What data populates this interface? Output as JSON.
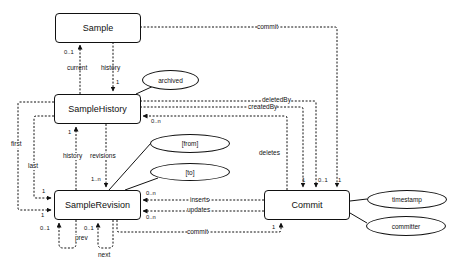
{
  "entities": {
    "sample": "Sample",
    "sample_history": "SampleHistory",
    "sample_revision": "SampleRevision",
    "commit": "Commit"
  },
  "attributes": {
    "archived": "archived",
    "from": "[from]",
    "to": "[to]",
    "timestamp": "timestamp",
    "committer": "committer"
  },
  "relationships": {
    "commit_top": "commit",
    "current": "current",
    "history": "history",
    "deleted_by": "deletedBy",
    "created_by": "createdBy",
    "deletes": "deletes",
    "first": "first",
    "last": "last",
    "history_rev": "history",
    "revisions": "revisions",
    "inserts": "inserts",
    "updates": "updates",
    "commit_bottom": "commit",
    "prev": "prev",
    "next": "next"
  },
  "cardinalities": {
    "current_0_1": "0..1",
    "history_1": "1",
    "deletes_0_n": "0..n",
    "history_rev_1": "1",
    "revisions_1_n": "1..n",
    "last_1": "1",
    "first_1": "1",
    "inserts_0_n": "0..n",
    "updates_0_n": "0..n",
    "prev_0_1": "0..1",
    "next_0_1": "0..1",
    "commit_deletes_1": "1",
    "commit_created_1": "1",
    "commit_deleted_0_1": "0..1",
    "commit_sample_1": "1",
    "commit_rev_1": "1"
  }
}
